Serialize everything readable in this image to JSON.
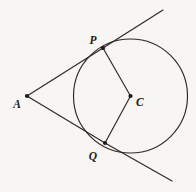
{
  "figure": {
    "background_color": "#f7f6f3",
    "stroke_color": "#2b2724",
    "label_color": "#1c1917",
    "width": 196,
    "height": 192
  },
  "circle": {
    "name": "circle-c",
    "center_label": "C",
    "center_x": 130.5,
    "center_y": 96,
    "radius": 57
  },
  "points": [
    {
      "id": "A",
      "label": "A",
      "x": 27,
      "y": 96,
      "label_x": 17,
      "label_y": 108,
      "role": "external-point"
    },
    {
      "id": "P",
      "label": "P",
      "x": 103,
      "y": 48,
      "label_x": 93,
      "label_y": 44,
      "role": "tangent-point-upper"
    },
    {
      "id": "C",
      "label": "C",
      "x": 130.5,
      "y": 96,
      "label_x": 136,
      "label_y": 106,
      "role": "circle-center"
    },
    {
      "id": "Q",
      "label": "Q",
      "x": 105,
      "y": 143,
      "label_x": 93,
      "label_y": 160,
      "role": "tangent-point-lower"
    }
  ],
  "segments": [
    {
      "id": "AP",
      "name": "tangent-segment-ap",
      "x1": 27,
      "y1": 96,
      "x2": 103,
      "y2": 48
    },
    {
      "id": "AQ",
      "name": "tangent-segment-aq",
      "x1": 27,
      "y1": 96,
      "x2": 105,
      "y2": 143
    },
    {
      "id": "PC",
      "name": "radius-segment-pc",
      "x1": 103,
      "y1": 48,
      "x2": 130.5,
      "y2": 96
    },
    {
      "id": "QC",
      "name": "radius-segment-qc",
      "x1": 105,
      "y1": 143,
      "x2": 130.5,
      "y2": 96
    },
    {
      "id": "P-ext",
      "name": "tangent-ray-upper-extension",
      "x1": 103,
      "y1": 48,
      "x2": 163,
      "y2": 10
    },
    {
      "id": "Q-ext",
      "name": "tangent-ray-lower-extension",
      "x1": 105,
      "y1": 143,
      "x2": 172,
      "y2": 181
    }
  ]
}
